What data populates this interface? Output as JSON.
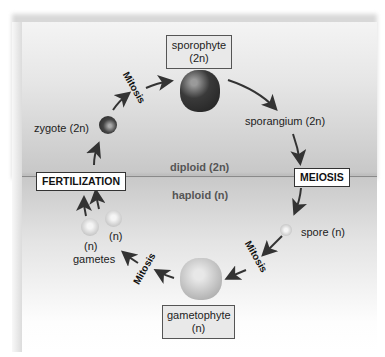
{
  "diagram": {
    "regions": {
      "diploid": "diploid (2n)",
      "haploid": "haploid (n)"
    },
    "stages": {
      "sporophyte": {
        "line1": "sporophyte",
        "line2": "(2n)"
      },
      "sporangium": "sporangium (2n)",
      "spore": "spore (n)",
      "gametophyte": {
        "line1": "gametophyte",
        "line2": "(n)"
      },
      "gametes": {
        "n1": "(n)",
        "n2": "(n)",
        "label": "gametes"
      },
      "zygote": "zygote (2n)"
    },
    "processes": {
      "meiosis": "MEIOSIS",
      "fertilization": "FERTILIZATION",
      "mitosis_top": "Mitosis",
      "mitosis_right": "Mitosis",
      "mitosis_left": "Mitosis"
    },
    "colors": {
      "diploid_region": "#c8c8c8",
      "haploid_region": "#e8e8e8",
      "arrow": "#333333",
      "box_fill": "#e9e9e9"
    }
  }
}
